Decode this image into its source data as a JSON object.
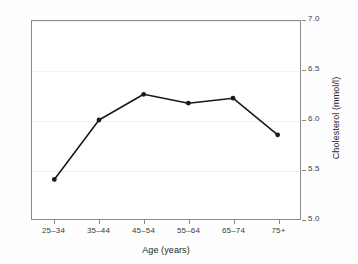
{
  "chart_data": {
    "type": "line",
    "title": "",
    "subtitle": "",
    "xlabel": "Age (years)",
    "ylabel": "Cholesterol (mmol/l)",
    "categories": [
      "25–34",
      "35–44",
      "45–54",
      "55–64",
      "65–74",
      "75+"
    ],
    "values": [
      5.4,
      6.0,
      6.26,
      6.17,
      6.22,
      5.85
    ],
    "series": [
      {
        "name": "Cholesterol",
        "values": [
          5.4,
          6.0,
          6.26,
          6.17,
          6.22,
          5.85
        ]
      }
    ],
    "ylim": [
      5.0,
      7.0
    ],
    "yticks": [
      "7.0",
      "6.5",
      "6.0",
      "5.5",
      "5.0"
    ],
    "ytick_values": [
      7.0,
      6.5,
      6.0,
      5.5,
      5.0
    ],
    "grid": true,
    "legend": "none",
    "y_axis_position": "right",
    "marker": "filled-circle",
    "line_color": "#1a1a1a",
    "marker_color": "#1a1a1a",
    "grid_color": "#f1f1f1",
    "frame_color": "#8a8a8a",
    "background_color": "#ffffff"
  }
}
